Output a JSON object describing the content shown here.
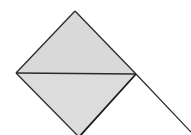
{
  "diagram": {
    "type": "geometric-figure",
    "colors": {
      "fill": "#d9d9d9",
      "stroke": "#2a2a2a",
      "background": "#ffffff"
    },
    "vertices": {
      "top": [
        75,
        11
      ],
      "left": [
        16,
        73
      ],
      "right": [
        136,
        74
      ],
      "bottom": [
        79,
        137
      ]
    },
    "extension_line": {
      "from": [
        136,
        74
      ],
      "to": [
        191,
        132
      ]
    }
  }
}
